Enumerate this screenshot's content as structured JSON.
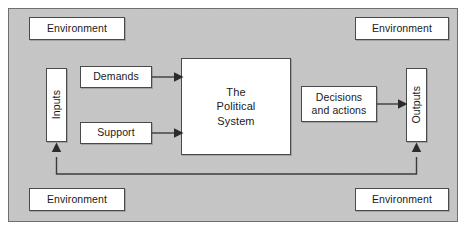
{
  "figure": {
    "title": "The Political System",
    "type": "systems-model-diagram",
    "background_color": "#c9c9c9",
    "frame_border_color": "#6f6f6f",
    "box_fill_color": "#ffffff",
    "box_border_color": "#4a4a4a",
    "connector_color": "#3c3c3c"
  },
  "environment": {
    "top_left": "Environment",
    "top_right": "Environment",
    "bottom_left": "Environment",
    "bottom_right": "Environment"
  },
  "nodes": {
    "inputs": "Inputs",
    "outputs": "Outputs",
    "demands": "Demands",
    "support": "Support",
    "political_system_line1": "The",
    "political_system_line2": "Political",
    "political_system_line3": "System",
    "decisions_line1": "Decisions",
    "decisions_line2": "and actions"
  },
  "connections": [
    {
      "from": "demands",
      "to": "political-system",
      "style": "arrow-right"
    },
    {
      "from": "support",
      "to": "political-system",
      "style": "arrow-right"
    },
    {
      "from": "decisions",
      "to": "outputs",
      "style": "arrow-right"
    },
    {
      "from": "feedback-loop",
      "to": "inputs",
      "style": "arrow-up"
    },
    {
      "from": "outputs",
      "to": "feedback-loop",
      "style": "arrow-up"
    }
  ]
}
